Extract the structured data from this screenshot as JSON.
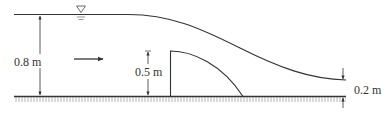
{
  "diagram": {
    "type": "open-channel flow over a weir",
    "labels": {
      "upstream_depth": "0.8 m",
      "weir_height": "0.5 m",
      "downstream_depth": "0.2 m"
    },
    "symbols": {
      "free_surface": "free-surface-triangle-icon",
      "flow_direction": "arrow-right-icon"
    },
    "colors": {
      "line": "#333333",
      "bed_hatch": "#9a9a9a",
      "background": "#ffffff"
    }
  }
}
